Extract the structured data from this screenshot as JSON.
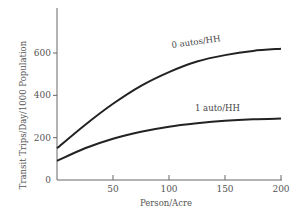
{
  "chart_data": {
    "type": "line",
    "title": "",
    "xlabel": "Person/Acre",
    "ylabel": "Transit Trips/Day/1000 Population",
    "xlim": [
      0,
      200
    ],
    "ylim": [
      0,
      800
    ],
    "x_ticks": [
      50,
      100,
      150,
      200
    ],
    "y_ticks": [
      0,
      200,
      400,
      600
    ],
    "x_tick_labels": [
      "50",
      "100",
      "150",
      "200"
    ],
    "y_tick_labels": [
      "0",
      "200",
      "400",
      "600"
    ],
    "grid": false,
    "legend": "inline labels on curves",
    "series": [
      {
        "name": "0 autos/HH",
        "x": [
          0,
          25,
          50,
          75,
          100,
          125,
          150,
          175,
          200
        ],
        "values": [
          150,
          260,
          360,
          445,
          510,
          560,
          590,
          610,
          620
        ]
      },
      {
        "name": "1 auto/HH",
        "x": [
          0,
          25,
          50,
          75,
          100,
          125,
          150,
          175,
          200
        ],
        "values": [
          90,
          150,
          195,
          228,
          252,
          268,
          280,
          287,
          290
        ]
      }
    ]
  },
  "labels": {
    "series0": "0 autos/HH",
    "series1": "1 auto/HH",
    "xlabel": "Person/Acre",
    "ylabel": "Transit Trips/Day/1000 Population"
  }
}
